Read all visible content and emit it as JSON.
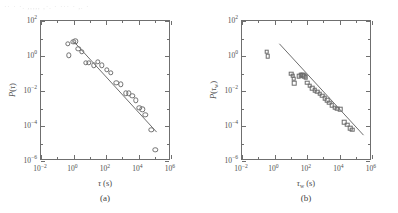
{
  "top_bleed_text": "·· ·  ·.  ,,,,, ,·. ·   ··· · ,. ·",
  "figure": {
    "panels": [
      {
        "id": "a",
        "caption": "(a)",
        "marker_shape": "circle",
        "xaxis": {
          "title_html": "<span class=\"ital\">&tau;</span> (s)",
          "ticks": [
            "10<sup>&minus;2</sup>",
            "10<sup>0</sup>",
            "10<sup>2</sup>",
            "10<sup>4</sup>",
            "10<sup>6</sup>"
          ],
          "tick_exponents": [
            -2,
            0,
            2,
            4,
            6
          ],
          "range": [
            -2,
            6
          ]
        },
        "yaxis": {
          "title_html": "<span class=\"ital\">P</span>(<span class=\"ital\">&tau;</span>)",
          "ticks": [
            "10<sup>2</sup>",
            "10<sup>0</sup>",
            "10<sup>&minus;2</sup>",
            "10<sup>&minus;4</sup>",
            "10<sup>&minus;6</sup>"
          ],
          "tick_exponents": [
            2,
            0,
            -2,
            -4,
            -6
          ],
          "range": [
            -6,
            2
          ]
        }
      },
      {
        "id": "b",
        "caption": "(b)",
        "marker_shape": "square",
        "xaxis": {
          "title_html": "<span class=\"ital\">&tau;</span><sub>w</sub> (s)",
          "ticks": [
            "10<sup>&minus;2</sup>",
            "10<sup>0</sup>",
            "10<sup>2</sup>",
            "10<sup>4</sup>",
            "10<sup>6</sup>"
          ],
          "tick_exponents": [
            -2,
            0,
            2,
            4,
            6
          ],
          "range": [
            -2,
            6
          ]
        },
        "yaxis": {
          "title_html": "<span class=\"ital\">P</span>(<span class=\"ital\">&tau;</span><sub>w</sub>)",
          "ticks": [
            "10<sup>2</sup>",
            "10<sup>0</sup>",
            "10<sup>&minus;2</sup>",
            "10<sup>&minus;4</sup>",
            "10<sup>&minus;6</sup>"
          ],
          "tick_exponents": [
            2,
            0,
            -2,
            -4,
            -6
          ],
          "range": [
            -6,
            2
          ]
        }
      }
    ]
  },
  "chart_data": [
    {
      "type": "scatter",
      "panel": "a",
      "title": "",
      "xlabel": "τ (s)",
      "ylabel": "P(τ)",
      "xscale": "log",
      "yscale": "log",
      "xlim": [
        0.01,
        1000000
      ],
      "ylim": [
        1e-06,
        100
      ],
      "grid": false,
      "legend": null,
      "marker": "open-circle",
      "series": [
        {
          "name": "P(τ) data",
          "points": [
            {
              "x": 0.45,
              "y": 5.0
            },
            {
              "x": 0.5,
              "y": 1.1
            },
            {
              "x": 0.95,
              "y": 6.5
            },
            {
              "x": 1.3,
              "y": 7.0
            },
            {
              "x": 2.0,
              "y": 2.6
            },
            {
              "x": 3.2,
              "y": 1.7
            },
            {
              "x": 5.5,
              "y": 0.42
            },
            {
              "x": 9.0,
              "y": 0.4
            },
            {
              "x": 18.0,
              "y": 0.3
            },
            {
              "x": 30.0,
              "y": 0.45
            },
            {
              "x": 55.0,
              "y": 0.3
            },
            {
              "x": 110.0,
              "y": 0.16
            },
            {
              "x": 200.0,
              "y": 0.11
            },
            {
              "x": 430.0,
              "y": 0.03
            },
            {
              "x": 800.0,
              "y": 0.024
            },
            {
              "x": 1600.0,
              "y": 0.0075
            },
            {
              "x": 2600.0,
              "y": 0.0075
            },
            {
              "x": 4200.0,
              "y": 0.0055
            },
            {
              "x": 7000.0,
              "y": 0.003
            },
            {
              "x": 11000.0,
              "y": 0.0011
            },
            {
              "x": 17000.0,
              "y": 0.0009
            },
            {
              "x": 26000.0,
              "y": 0.00042
            },
            {
              "x": 60000.0,
              "y": 6e-05
            },
            {
              "x": 110000.0,
              "y": 4.5e-06
            }
          ]
        }
      ],
      "fit_line": {
        "label": "power-law fit",
        "x_start": 1.0,
        "y_start": 7.0,
        "x_end": 130000.0,
        "y_end": 4.5e-05,
        "slope": -1.0
      }
    },
    {
      "type": "scatter",
      "panel": "b",
      "title": "",
      "xlabel": "τ_w (s)",
      "ylabel": "P(τ_w)",
      "xscale": "log",
      "yscale": "log",
      "xlim": [
        0.01,
        1000000
      ],
      "ylim": [
        1e-06,
        100
      ],
      "grid": false,
      "legend": null,
      "marker": "open-square",
      "series": [
        {
          "name": "P(τ_w) data",
          "points": [
            {
              "x": 0.33,
              "y": 1.8
            },
            {
              "x": 0.38,
              "y": 1.0
            },
            {
              "x": 11.0,
              "y": 0.095
            },
            {
              "x": 13.0,
              "y": 0.075
            },
            {
              "x": 15.0,
              "y": 0.05
            },
            {
              "x": 17.0,
              "y": 0.028
            },
            {
              "x": 30.0,
              "y": 0.072
            },
            {
              "x": 40.0,
              "y": 0.08
            },
            {
              "x": 50.0,
              "y": 0.085
            },
            {
              "x": 60.0,
              "y": 0.078
            },
            {
              "x": 70.0,
              "y": 0.07
            },
            {
              "x": 85.0,
              "y": 0.06
            },
            {
              "x": 100.0,
              "y": 0.03
            },
            {
              "x": 150.0,
              "y": 0.02
            },
            {
              "x": 210.0,
              "y": 0.014
            },
            {
              "x": 300.0,
              "y": 0.011
            },
            {
              "x": 420.0,
              "y": 0.009
            },
            {
              "x": 600.0,
              "y": 0.007
            },
            {
              "x": 850.0,
              "y": 0.0055
            },
            {
              "x": 1200.0,
              "y": 0.0038
            },
            {
              "x": 1700.0,
              "y": 0.003
            },
            {
              "x": 2400.0,
              "y": 0.0022
            },
            {
              "x": 3400.0,
              "y": 0.0016
            },
            {
              "x": 5000.0,
              "y": 0.0011
            },
            {
              "x": 7500.0,
              "y": 0.00095
            },
            {
              "x": 11000.0,
              "y": 0.0009
            },
            {
              "x": 20000.0,
              "y": 0.00016
            },
            {
              "x": 30000.0,
              "y": 0.00012
            },
            {
              "x": 45000.0,
              "y": 7.5e-05
            },
            {
              "x": 60000.0,
              "y": 6e-05
            }
          ]
        }
      ],
      "fit_line": {
        "label": "power-law fit",
        "x_start": 2.0,
        "y_start": 5.0,
        "x_end": 300000.0,
        "y_end": 3e-05,
        "slope": -1.0
      }
    }
  ]
}
